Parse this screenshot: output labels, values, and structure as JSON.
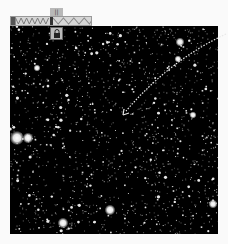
{
  "toolbar": {
    "tab_label": "||",
    "segments": [
      "zigzag-dark",
      "separator",
      "zigzag-light"
    ],
    "lock_icon": "padlock-icon"
  },
  "image": {
    "description": "dense star field",
    "background": "#000000",
    "star_color": "#ffffff",
    "bright_stars": [
      {
        "x": 17,
        "y": 138,
        "r": 4
      },
      {
        "x": 28,
        "y": 138,
        "r": 3
      },
      {
        "x": 110,
        "y": 210,
        "r": 3
      },
      {
        "x": 63,
        "y": 223,
        "r": 3
      },
      {
        "x": 213,
        "y": 204,
        "r": 2.5
      },
      {
        "x": 180,
        "y": 42,
        "r": 2.5
      },
      {
        "x": 37,
        "y": 68,
        "r": 2
      },
      {
        "x": 178,
        "y": 59,
        "r": 2
      },
      {
        "x": 193,
        "y": 115,
        "r": 2
      }
    ]
  },
  "annotation": {
    "type": "dashed-arrow",
    "color": "#e8e8e8",
    "from": {
      "x": 226,
      "y": 34
    },
    "to": {
      "x": 123,
      "y": 114
    }
  }
}
